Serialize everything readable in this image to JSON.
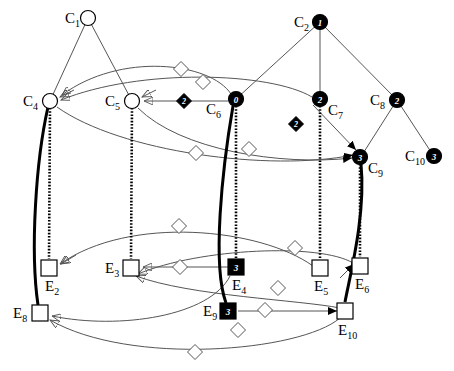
{
  "diagram": {
    "colors": {
      "stroke_light": "#555555",
      "stroke_dark": "#000000",
      "fill_white": "#ffffff",
      "fill_black": "#000000",
      "text": "#000000"
    },
    "concept_nodes": [
      {
        "id": "C1",
        "label": "C",
        "sub": "1",
        "x": 88,
        "y": 18,
        "shape": "circle",
        "filled": false,
        "marker": ""
      },
      {
        "id": "C2",
        "label": "C",
        "sub": "2",
        "x": 320,
        "y": 22,
        "shape": "circle",
        "filled": true,
        "marker": "1"
      },
      {
        "id": "C4",
        "label": "C",
        "sub": "4",
        "x": 50,
        "y": 101,
        "shape": "circle",
        "filled": false,
        "marker": ""
      },
      {
        "id": "C5",
        "label": "C",
        "sub": "5",
        "x": 132,
        "y": 101,
        "shape": "circle",
        "filled": false,
        "marker": ""
      },
      {
        "id": "C6",
        "label": "C",
        "sub": "6",
        "x": 236,
        "y": 99,
        "shape": "circle",
        "filled": true,
        "marker": "0"
      },
      {
        "id": "C7",
        "label": "C",
        "sub": "7",
        "x": 320,
        "y": 99,
        "shape": "circle",
        "filled": true,
        "marker": "2"
      },
      {
        "id": "C8",
        "label": "C",
        "sub": "8",
        "x": 397,
        "y": 100,
        "shape": "circle",
        "filled": true,
        "marker": "2"
      },
      {
        "id": "C9",
        "label": "C",
        "sub": "9",
        "x": 360,
        "y": 157,
        "shape": "circle",
        "filled": true,
        "marker": "3"
      },
      {
        "id": "C10",
        "label": "C",
        "sub": "10",
        "x": 434,
        "y": 156,
        "shape": "circle",
        "filled": true,
        "marker": "3"
      }
    ],
    "entity_nodes": [
      {
        "id": "E2",
        "label": "E",
        "sub": "2",
        "x": 49,
        "y": 268,
        "shape": "square",
        "filled": false,
        "marker": ""
      },
      {
        "id": "E3",
        "label": "E",
        "sub": "3",
        "x": 131,
        "y": 268,
        "shape": "square",
        "filled": false,
        "marker": ""
      },
      {
        "id": "E4",
        "label": "E",
        "sub": "4",
        "x": 236,
        "y": 267,
        "shape": "square",
        "filled": true,
        "marker": "3"
      },
      {
        "id": "E5",
        "label": "E",
        "sub": "5",
        "x": 320,
        "y": 268,
        "shape": "square",
        "filled": false,
        "marker": ""
      },
      {
        "id": "E6",
        "label": "E",
        "sub": "6",
        "x": 360,
        "y": 266,
        "shape": "square",
        "filled": false,
        "marker": ""
      },
      {
        "id": "E8",
        "label": "E",
        "sub": "8",
        "x": 40,
        "y": 313,
        "shape": "square",
        "filled": false,
        "marker": ""
      },
      {
        "id": "E9",
        "label": "E",
        "sub": "9",
        "x": 228,
        "y": 311,
        "shape": "square",
        "filled": true,
        "marker": "3"
      },
      {
        "id": "E10",
        "label": "E",
        "sub": "10",
        "x": 345,
        "y": 311,
        "shape": "square",
        "filled": false,
        "marker": ""
      }
    ],
    "node_label_offsets": {
      "C1": {
        "dx": -23,
        "dy": -7
      },
      "C2": {
        "dx": -26,
        "dy": -7
      },
      "C4": {
        "dx": -27,
        "dy": -7
      },
      "C5": {
        "dx": -27,
        "dy": -7
      },
      "C6": {
        "dx": -30,
        "dy": 3
      },
      "C7": {
        "dx": 8,
        "dy": 4
      },
      "C8": {
        "dx": -27,
        "dy": -7
      },
      "C9": {
        "dx": 8,
        "dy": 4
      },
      "C10": {
        "dx": -29,
        "dy": -7
      },
      "E2": {
        "dx": -4,
        "dy": 11
      },
      "E3": {
        "dx": -26,
        "dy": -7
      },
      "E4": {
        "dx": -4,
        "dy": 11
      },
      "E5": {
        "dx": -6,
        "dy": 11
      },
      "E6": {
        "dx": -5,
        "dy": 11
      },
      "E8": {
        "dx": -27,
        "dy": -7
      },
      "E9": {
        "dx": -25,
        "dy": -7
      },
      "E10": {
        "dx": -7,
        "dy": 12
      }
    },
    "edge_diamonds": [
      {
        "id": "d1",
        "x": 184,
        "y": 101,
        "filled": true,
        "marker": "2"
      },
      {
        "id": "d2",
        "x": 296,
        "y": 124,
        "filled": true,
        "marker": "2"
      },
      {
        "id": "d3",
        "x": 181,
        "y": 69,
        "filled": false,
        "marker": ""
      },
      {
        "id": "d4",
        "x": 203,
        "y": 82,
        "filled": false,
        "marker": ""
      },
      {
        "id": "d5",
        "x": 196,
        "y": 153,
        "filled": false,
        "marker": ""
      },
      {
        "id": "d6",
        "x": 249,
        "y": 149,
        "filled": false,
        "marker": ""
      },
      {
        "id": "d7",
        "x": 179,
        "y": 226,
        "filled": false,
        "marker": ""
      },
      {
        "id": "d8",
        "x": 180,
        "y": 267,
        "filled": false,
        "marker": ""
      },
      {
        "id": "d9",
        "x": 295,
        "y": 248,
        "filled": false,
        "marker": ""
      },
      {
        "id": "d10",
        "x": 278,
        "y": 288,
        "timing": "",
        "filled": false,
        "marker": ""
      },
      {
        "id": "d11",
        "x": 265,
        "y": 310,
        "filled": false,
        "marker": ""
      },
      {
        "id": "d12",
        "x": 238,
        "y": 330,
        "filled": false,
        "marker": ""
      },
      {
        "id": "d13",
        "x": 195,
        "y": 352,
        "filled": false,
        "marker": ""
      }
    ],
    "tree_edges": [
      {
        "from": "C1",
        "to": "C4"
      },
      {
        "from": "C1",
        "to": "C5"
      },
      {
        "from": "C2",
        "to": "C6"
      },
      {
        "from": "C2",
        "to": "C7"
      },
      {
        "from": "C2",
        "to": "C8"
      },
      {
        "from": "C8",
        "to": "C9"
      },
      {
        "from": "C8",
        "to": "C10"
      }
    ],
    "instance_links": [
      {
        "from": "C4",
        "to": "E2",
        "style": "dotted"
      },
      {
        "from": "C4",
        "to": "E8",
        "style": "solid-thick"
      },
      {
        "from": "C5",
        "to": "E3",
        "style": "dotted"
      },
      {
        "from": "C6",
        "to": "E4",
        "style": "dotted"
      },
      {
        "from": "C6",
        "to": "E9",
        "style": "solid-thick"
      },
      {
        "from": "C7",
        "to": "E5",
        "style": "dotted"
      },
      {
        "from": "C9",
        "to": "E6",
        "style": "dotted"
      },
      {
        "from": "C9",
        "to": "E10",
        "style": "solid-thick"
      }
    ],
    "relation_edges": [
      {
        "from": "C6",
        "to": "C5",
        "diamond": "d1",
        "direction": "to-left"
      },
      {
        "from": "C7",
        "to": "C9",
        "diamond": "d2",
        "direction": "to-right"
      },
      {
        "from": "C6",
        "to": "C4",
        "diamond": "d3",
        "direction": "curve"
      },
      {
        "from": "C7",
        "to": "C4",
        "diamond": "d4",
        "direction": "curve"
      },
      {
        "from": "C5",
        "to": "C9",
        "diamond": "d5",
        "direction": "curve"
      },
      {
        "from": "C4",
        "to": "C9",
        "diamond": "d6",
        "direction": "curve"
      },
      {
        "from": "E4",
        "to": "E3",
        "diamond": "d8",
        "direction": "to-left"
      },
      {
        "from": "E9",
        "to": "E10",
        "diamond": "d11",
        "direction": "to-right"
      },
      {
        "from": "E5",
        "to": "E2",
        "diamond": "d7",
        "direction": "curve"
      },
      {
        "from": "E6",
        "to": "E3",
        "diamond": "d9",
        "direction": "curve"
      },
      {
        "from": "E10",
        "to": "E3",
        "diamond": "d10",
        "direction": "curve"
      },
      {
        "from": "E4",
        "to": "E8",
        "diamond": "d12",
        "direction": "curve"
      },
      {
        "from": "E10",
        "to": "E8",
        "diamond": "d13",
        "direction": "curve"
      }
    ]
  }
}
